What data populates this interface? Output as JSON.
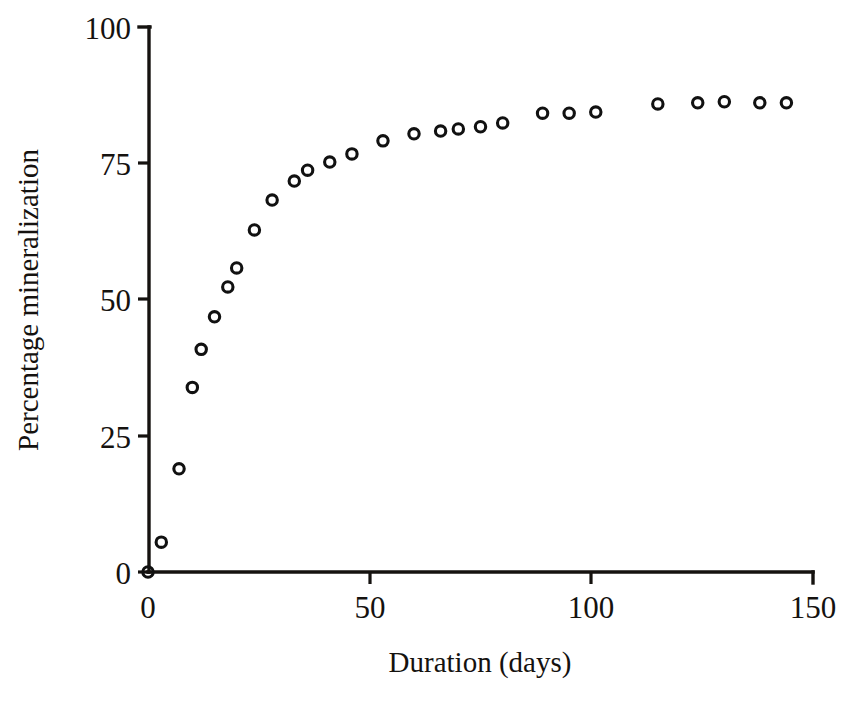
{
  "chart_data": {
    "type": "scatter",
    "title": "",
    "xlabel": "Duration (days)",
    "ylabel": "Percentage mineralization",
    "xlim": [
      0,
      150
    ],
    "ylim": [
      0,
      100
    ],
    "xticks": [
      0,
      50,
      100,
      150
    ],
    "xtick_labels": [
      "0",
      "50",
      "100",
      "150"
    ],
    "yticks": [
      0,
      25,
      50,
      75,
      100
    ],
    "ytick_labels": [
      "0",
      "25",
      "50",
      "75",
      "100"
    ],
    "grid": false,
    "legend": false,
    "marker": "open-circle",
    "marker_color": "#111111",
    "series": [
      {
        "name": "mineralization",
        "x": [
          0,
          3,
          7,
          10,
          12,
          15,
          18,
          20,
          24,
          28,
          33,
          36,
          41,
          46,
          53,
          60,
          66,
          70,
          75,
          80,
          89,
          95,
          101,
          115,
          124,
          130,
          138,
          144
        ],
        "y": [
          0,
          5.5,
          19,
          34,
          41,
          47,
          52.5,
          56,
          63,
          68.5,
          72,
          74,
          75.5,
          77,
          79.4,
          80.7,
          81.2,
          81.6,
          82,
          82.7,
          84.5,
          84.5,
          84.7,
          86.2,
          86.4,
          86.6,
          86.4,
          86.4
        ]
      }
    ]
  },
  "axis": {
    "x_title": "Duration (days)",
    "y_title": "Percentage mineralization"
  },
  "ytick_labels": {
    "t0": "0",
    "t25": "25",
    "t50": "50",
    "t75": "75",
    "t100": "100"
  },
  "xtick_labels": {
    "t0": "0",
    "t50": "50",
    "t100": "100",
    "t150": "150"
  }
}
